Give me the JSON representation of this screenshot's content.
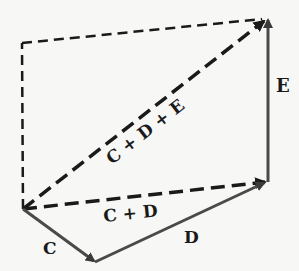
{
  "diagram": {
    "title": "",
    "colors": {
      "solid_vector": "#4a4a4a",
      "dashed_line": "#1a1a1a",
      "text": "#1a1a1a",
      "background": "#f7f7f5"
    },
    "points": {
      "origin": [
        23,
        209
      ],
      "c_tip": [
        95,
        262
      ],
      "d_tip": [
        267,
        182
      ],
      "e_tip": [
        268,
        18
      ],
      "dashed_corner": [
        22,
        43
      ]
    },
    "vectors": [
      {
        "id": "C",
        "label": "C",
        "style": "solid",
        "from": "origin",
        "to": "c_tip"
      },
      {
        "id": "D",
        "label": "D",
        "style": "solid",
        "from": "c_tip",
        "to": "d_tip"
      },
      {
        "id": "E",
        "label": "E",
        "style": "solid",
        "from": "d_tip",
        "to": "e_tip"
      },
      {
        "id": "CD",
        "label": "C + D",
        "style": "dashed",
        "from": "origin",
        "to": "d_tip"
      },
      {
        "id": "CDE",
        "label": "C + D + E",
        "style": "dashed",
        "from": "origin",
        "to": "e_tip"
      }
    ],
    "construction_lines": [
      {
        "style": "dashed",
        "from": "origin",
        "to": "dashed_corner"
      },
      {
        "style": "dashed",
        "from": "dashed_corner",
        "to": "e_tip"
      }
    ],
    "labels": {
      "c": "C",
      "d": "D",
      "e": "E",
      "cd": "C + D",
      "cde": "C + D + E"
    }
  }
}
